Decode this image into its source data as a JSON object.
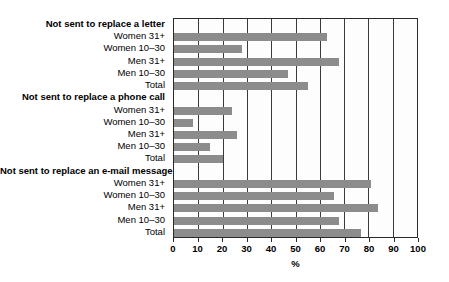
{
  "chart_data": {
    "type": "bar",
    "orientation": "horizontal",
    "title": "",
    "xlabel": "%",
    "ylabel": "",
    "xlim": [
      0,
      100
    ],
    "xticks": [
      0,
      10,
      20,
      30,
      40,
      50,
      60,
      70,
      80,
      90,
      100
    ],
    "grid": true,
    "legend": "none",
    "bar_color": "#8c8c8c",
    "groups": [
      {
        "header": "Not sent to replace a letter",
        "categories": [
          "Women 31+",
          "Women 10–30",
          "Men 31+",
          "Men 10–30",
          "Total"
        ],
        "values": [
          63,
          28,
          68,
          47,
          55
        ]
      },
      {
        "header": "Not sent to replace a phone call",
        "categories": [
          "Women 31+",
          "Women 10–30",
          "Men 31+",
          "Men 10–30",
          "Total"
        ],
        "values": [
          24,
          8,
          26,
          15,
          20
        ]
      },
      {
        "header": "Not sent to replace an e-mail message",
        "categories": [
          "Women 31+",
          "Women 10–30",
          "Men 31+",
          "Men 10–30",
          "Total"
        ],
        "values": [
          81,
          66,
          84,
          68,
          77
        ]
      }
    ]
  }
}
